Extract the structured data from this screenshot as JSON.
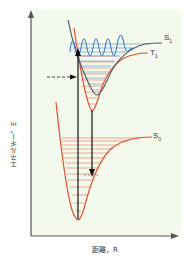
{
  "axes": {
    "y_label": "エネルギー，E",
    "x_label": "距離，R"
  },
  "states": [
    {
      "name": "S",
      "sub": "1",
      "color": "#555a66"
    },
    {
      "name": "T",
      "sub": "1",
      "color": "#e0502a"
    },
    {
      "name": "S",
      "sub": "0",
      "color": "#e0502a"
    }
  ],
  "colors": {
    "background": "#f4f9ee",
    "axis": "#555555",
    "potential_s0_t1": "#e0502a",
    "potential_s1": "#555a66",
    "vibrational_levels": "#e07050",
    "s1_levels": "#6688bb",
    "wavefunction": "#3a7cc8",
    "arrows": "#111111"
  },
  "annotations": {
    "absorption_arrow": "S0 → S1 (up)",
    "emission_arrow": "T1 → S0 (down)",
    "intersystem_crossing": "dashed arrow"
  }
}
